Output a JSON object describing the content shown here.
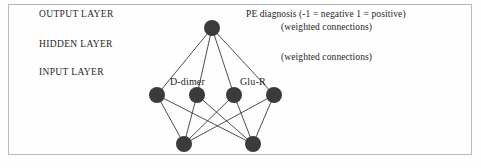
{
  "figure": {
    "border_color": "#b9b9b9",
    "background_color": "#fefefe",
    "node_color": "#3b3b3b",
    "edge_color": "#3a3a3a"
  },
  "layer_labels": {
    "output": "OUTPUT LAYER",
    "hidden": "HIDDEN LAYER",
    "input": "INPUT LAYER"
  },
  "annotations": {
    "pe_diagnosis": "PE diagnosis (-1 = negative 1 = positive)",
    "weighted_connections_top": "(weighted connections)",
    "weighted_connections_bottom": "(weighted connections)"
  },
  "node_labels": {
    "d_dimer": "D-dimer",
    "glu_r": "Glu-R"
  },
  "chart_data": {
    "type": "diagram",
    "diagram_kind": "neural-network",
    "layers": [
      {
        "name": "OUTPUT LAYER",
        "node_count": 1,
        "nodes": [
          {
            "id": "out1",
            "cx": 212,
            "cy": 28,
            "r": 8,
            "label": ""
          }
        ]
      },
      {
        "name": "HIDDEN LAYER",
        "node_count": 4,
        "nodes": [
          {
            "id": "h1",
            "cx": 157,
            "cy": 95,
            "r": 8,
            "label": ""
          },
          {
            "id": "h2",
            "cx": 197,
            "cy": 95,
            "r": 8,
            "label": "D-dimer"
          },
          {
            "id": "h3",
            "cx": 234,
            "cy": 95,
            "r": 8,
            "label": ""
          },
          {
            "id": "h4",
            "cx": 274,
            "cy": 95,
            "r": 8,
            "label": "Glu-R"
          }
        ]
      },
      {
        "name": "INPUT LAYER",
        "node_count": 2,
        "nodes": [
          {
            "id": "i1",
            "cx": 184,
            "cy": 144,
            "r": 8,
            "label": ""
          },
          {
            "id": "i2",
            "cx": 253,
            "cy": 144,
            "r": 8,
            "label": ""
          }
        ]
      }
    ],
    "edges": [
      {
        "from": "out1",
        "to": "h1"
      },
      {
        "from": "out1",
        "to": "h2"
      },
      {
        "from": "out1",
        "to": "h3"
      },
      {
        "from": "out1",
        "to": "h4"
      },
      {
        "from": "h1",
        "to": "i1"
      },
      {
        "from": "h1",
        "to": "i2"
      },
      {
        "from": "h2",
        "to": "i1"
      },
      {
        "from": "h2",
        "to": "i2"
      },
      {
        "from": "h3",
        "to": "i1"
      },
      {
        "from": "h3",
        "to": "i2"
      },
      {
        "from": "h4",
        "to": "i1"
      },
      {
        "from": "h4",
        "to": "i2"
      }
    ]
  }
}
